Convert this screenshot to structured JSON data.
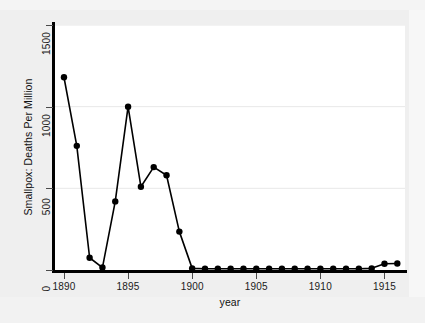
{
  "chart_data": {
    "type": "line",
    "title": "",
    "xlabel": "year",
    "ylabel": "Smallpox: Deaths Per Million",
    "xlim": [
      1889.3,
      1916.6
    ],
    "ylim": [
      0,
      1500
    ],
    "xticks": [
      1890,
      1895,
      1900,
      1905,
      1910,
      1915
    ],
    "yticks": [
      0,
      500,
      1000,
      1500
    ],
    "xtick_labels": [
      "1890",
      "1895",
      "1900",
      "1905",
      "1910",
      "1915"
    ],
    "ytick_labels": [
      "0",
      "500",
      "1000",
      "1500"
    ],
    "grid": "horizontal-faint",
    "legend": "none",
    "line_color": "#000000",
    "marker": "filled-circle",
    "marker_color": "#000000",
    "background_color": "#efefef",
    "plot_background_color": "#ffffff",
    "x": [
      1890,
      1891,
      1892,
      1893,
      1894,
      1895,
      1896,
      1897,
      1898,
      1899,
      1900,
      1901,
      1902,
      1903,
      1904,
      1905,
      1906,
      1907,
      1908,
      1909,
      1910,
      1911,
      1912,
      1913,
      1914,
      1915,
      1916
    ],
    "values": [
      1180,
      760,
      75,
      15,
      420,
      1000,
      510,
      630,
      580,
      235,
      10,
      8,
      8,
      8,
      8,
      8,
      8,
      8,
      8,
      8,
      8,
      8,
      8,
      8,
      10,
      38,
      40
    ],
    "series": [
      {
        "name": "Smallpox deaths per million",
        "values": [
          1180,
          760,
          75,
          15,
          420,
          1000,
          510,
          630,
          580,
          235,
          10,
          8,
          8,
          8,
          8,
          8,
          8,
          8,
          8,
          8,
          8,
          8,
          8,
          8,
          10,
          38,
          40
        ]
      }
    ]
  }
}
